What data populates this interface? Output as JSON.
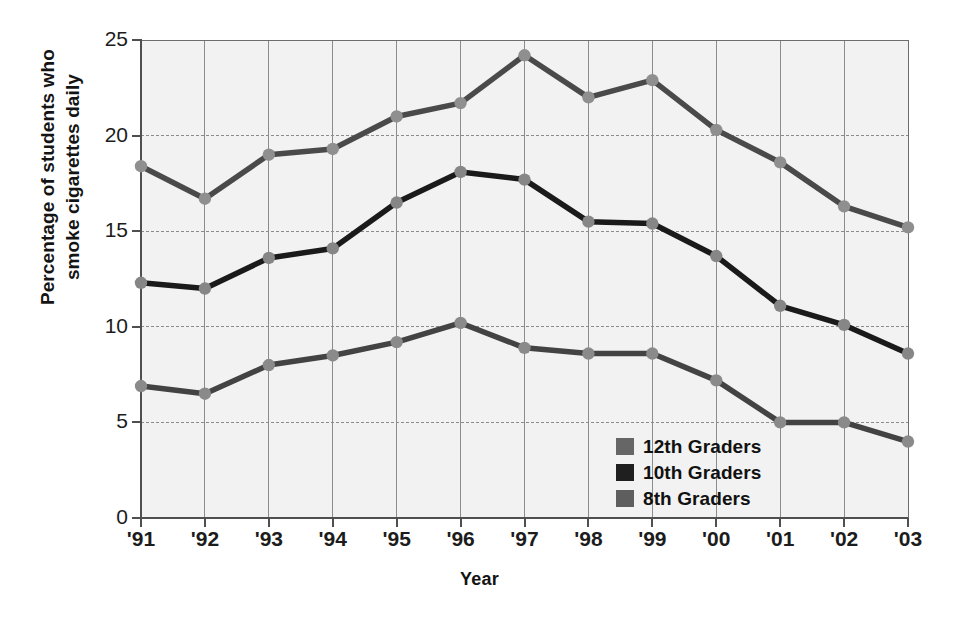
{
  "chart_data": {
    "type": "line",
    "title": "",
    "xlabel": "Year",
    "ylabel": "Percentage of students who smoke cigarettes daily",
    "ylabel_lines": [
      "Percentage of students who",
      "smoke cigarettes daily"
    ],
    "categories": [
      "'91",
      "'92",
      "'93",
      "'94",
      "'95",
      "'96",
      "'97",
      "'98",
      "'99",
      "'00",
      "'01",
      "'02",
      "'03"
    ],
    "xlim": [
      0,
      12
    ],
    "ylim": [
      0,
      25
    ],
    "yticks": [
      0,
      5,
      10,
      15,
      20,
      25
    ],
    "ytick_labels": [
      "0",
      "5",
      "10",
      "15",
      "20",
      "25"
    ],
    "grid": true,
    "legend_position": "lower-right-inside",
    "series": [
      {
        "name": "12th Graders",
        "color": "#4a4a4a",
        "marker_color": "#8f8f8f",
        "values": [
          18.4,
          16.7,
          19.0,
          19.3,
          21.0,
          21.7,
          24.2,
          22.0,
          22.9,
          20.3,
          18.6,
          16.3,
          15.2
        ]
      },
      {
        "name": "10th Graders",
        "color": "#1a1a1a",
        "marker_color": "#868686",
        "values": [
          12.3,
          12.0,
          13.6,
          14.1,
          16.5,
          18.1,
          17.7,
          15.5,
          15.4,
          13.7,
          11.1,
          10.1,
          8.6
        ]
      },
      {
        "name": "8th Graders",
        "color": "#434343",
        "marker_color": "#8a8a8a",
        "values": [
          6.9,
          6.5,
          8.0,
          8.5,
          9.2,
          10.2,
          8.9,
          8.6,
          8.6,
          7.2,
          5.0,
          5.0,
          4.0
        ]
      }
    ],
    "legend": [
      {
        "label": "12th Graders",
        "swatch_color": "#666666"
      },
      {
        "label": "10th Graders",
        "swatch_color": "#1f1f1f"
      },
      {
        "label": "8th Graders",
        "swatch_color": "#5e5e5e"
      }
    ],
    "colors": {
      "plot_background": "#f2f2f2",
      "grid": "#8c8c8c",
      "axis": "#4f4f4f",
      "text": "#161616"
    }
  }
}
